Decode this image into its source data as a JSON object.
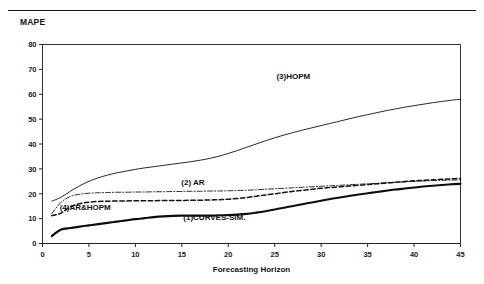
{
  "header": {
    "corner_label": "MAPE",
    "rule": "horizontal-rule"
  },
  "chart_data": {
    "type": "line",
    "title": "",
    "ylabel": "MAPE",
    "xlabel": "Forecasting Horizon",
    "xlim": [
      0,
      45
    ],
    "ylim": [
      0,
      80
    ],
    "xticks": [
      0,
      5,
      10,
      15,
      20,
      25,
      30,
      35,
      40,
      45
    ],
    "yticks": [
      0,
      10,
      20,
      30,
      40,
      50,
      60,
      70,
      80
    ],
    "grid": false,
    "legend": "inline-annotations",
    "series": [
      {
        "name": "(3)HOPM",
        "style": "solid",
        "width": 0.9,
        "color": "#111111",
        "label_x": 27,
        "label_y": 66,
        "x": [
          1,
          2,
          3,
          4,
          5,
          6,
          7,
          8,
          9,
          10,
          11,
          12,
          13,
          14,
          15,
          16,
          17,
          18,
          19,
          20,
          21,
          22,
          23,
          24,
          25,
          26,
          27,
          28,
          29,
          30,
          31,
          32,
          33,
          34,
          35,
          36,
          37,
          38,
          39,
          40,
          41,
          42,
          43,
          44,
          45
        ],
        "y": [
          17.0,
          18.6,
          21.0,
          23.2,
          25.0,
          26.4,
          27.5,
          28.4,
          29.1,
          29.8,
          30.4,
          30.9,
          31.4,
          31.9,
          32.4,
          32.9,
          33.5,
          34.2,
          35.1,
          36.2,
          37.4,
          38.7,
          40.0,
          41.3,
          42.5,
          43.6,
          44.6,
          45.6,
          46.5,
          47.4,
          48.3,
          49.2,
          50.1,
          51.0,
          51.8,
          52.6,
          53.4,
          54.1,
          54.8,
          55.4,
          56.0,
          56.6,
          57.1,
          57.6,
          58.0
        ]
      },
      {
        "name": "(2) AR",
        "style": "dashdot",
        "width": 0.9,
        "color": "#111111",
        "label_x": 16.2,
        "label_y": 23.5,
        "x": [
          1,
          2,
          3,
          4,
          5,
          6,
          7,
          8,
          9,
          10,
          11,
          12,
          13,
          14,
          15,
          16,
          17,
          18,
          19,
          20,
          21,
          22,
          23,
          24,
          25,
          26,
          27,
          28,
          29,
          30,
          31,
          32,
          33,
          34,
          35,
          36,
          37,
          38,
          39,
          40,
          41,
          42,
          43,
          44,
          45
        ],
        "y": [
          12.0,
          16.6,
          18.9,
          19.8,
          20.2,
          20.4,
          20.5,
          20.6,
          20.6,
          20.7,
          20.7,
          20.8,
          20.8,
          20.9,
          20.9,
          21.0,
          21.0,
          21.1,
          21.1,
          21.2,
          21.3,
          21.4,
          21.6,
          21.8,
          22.0,
          22.2,
          22.4,
          22.6,
          22.8,
          23.0,
          23.2,
          23.4,
          23.6,
          23.8,
          24.0,
          24.2,
          24.4,
          24.6,
          24.8,
          25.0,
          25.1,
          25.3,
          25.4,
          25.5,
          25.6
        ]
      },
      {
        "name": "(4)AR&HOPM",
        "style": "dashed",
        "width": 1.5,
        "color": "#111111",
        "label_x": 4.6,
        "label_y": 13.6,
        "x": [
          1,
          2,
          3,
          4,
          5,
          6,
          7,
          8,
          9,
          10,
          11,
          12,
          13,
          14,
          15,
          16,
          17,
          18,
          19,
          20,
          21,
          22,
          23,
          24,
          25,
          26,
          27,
          28,
          29,
          30,
          31,
          32,
          33,
          34,
          35,
          36,
          37,
          38,
          39,
          40,
          41,
          42,
          43,
          44,
          45
        ],
        "y": [
          11.2,
          12.2,
          14.8,
          16.0,
          16.6,
          16.9,
          17.0,
          17.1,
          17.1,
          17.2,
          17.2,
          17.2,
          17.3,
          17.3,
          17.3,
          17.4,
          17.4,
          17.5,
          17.6,
          17.8,
          18.1,
          18.5,
          19.0,
          19.5,
          20.0,
          20.5,
          21.0,
          21.4,
          21.8,
          22.2,
          22.5,
          22.8,
          23.1,
          23.4,
          23.7,
          24.0,
          24.3,
          24.6,
          24.9,
          25.2,
          25.4,
          25.6,
          25.8,
          26.0,
          26.2
        ]
      },
      {
        "name": "(1)CURVES-SIM.",
        "style": "solid",
        "width": 2.1,
        "color": "#0d0d0d",
        "label_x": 18.5,
        "label_y": 9.6,
        "x": [
          1,
          2,
          3,
          4,
          5,
          6,
          7,
          8,
          9,
          10,
          11,
          12,
          13,
          14,
          15,
          16,
          17,
          18,
          19,
          20,
          21,
          22,
          23,
          24,
          25,
          26,
          27,
          28,
          29,
          30,
          31,
          32,
          33,
          34,
          35,
          36,
          37,
          38,
          39,
          40,
          41,
          42,
          43,
          44,
          45
        ],
        "y": [
          3.0,
          5.6,
          6.2,
          6.8,
          7.3,
          7.8,
          8.3,
          8.8,
          9.3,
          9.8,
          10.2,
          10.6,
          10.9,
          11.1,
          11.2,
          11.2,
          11.2,
          11.2,
          11.3,
          11.4,
          11.6,
          11.9,
          12.4,
          13.0,
          13.7,
          14.4,
          15.1,
          15.8,
          16.5,
          17.2,
          17.9,
          18.5,
          19.1,
          19.7,
          20.2,
          20.7,
          21.2,
          21.7,
          22.1,
          22.5,
          22.9,
          23.2,
          23.5,
          23.8,
          24.0
        ]
      }
    ]
  }
}
